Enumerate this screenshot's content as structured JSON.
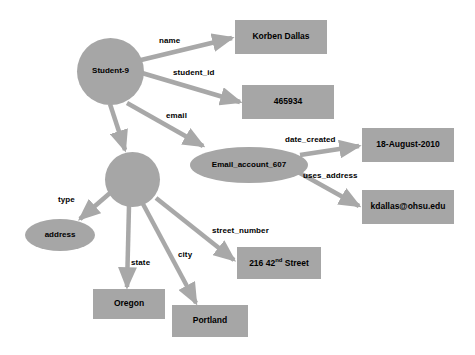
{
  "diagram": {
    "colors": {
      "node_fill": "#a6a6a6",
      "edge_stroke": "#a8a8a8",
      "text": "#000000",
      "background": "#ffffff"
    },
    "nodes": [
      {
        "id": "student",
        "label": "Student-9",
        "shape": "circle",
        "x": 77,
        "y": 38,
        "w": 67,
        "h": 67
      },
      {
        "id": "name_val",
        "label": "Korben Dallas",
        "shape": "rect",
        "x": 235,
        "y": 20,
        "w": 92,
        "h": 34
      },
      {
        "id": "sid_val",
        "label": "465934",
        "shape": "rect",
        "x": 242,
        "y": 85,
        "w": 92,
        "h": 34
      },
      {
        "id": "email_acct",
        "label": "Email_account_607",
        "shape": "ellipse",
        "x": 190,
        "y": 147,
        "w": 118,
        "h": 36
      },
      {
        "id": "date_val",
        "label": "18-August-2010",
        "shape": "rect",
        "x": 362,
        "y": 128,
        "w": 92,
        "h": 34
      },
      {
        "id": "emailaddr_val",
        "label": "kdallas@ohsu.edu",
        "shape": "rect",
        "x": 362,
        "y": 190,
        "w": 92,
        "h": 34
      },
      {
        "id": "addr_node",
        "label": "",
        "shape": "circle",
        "x": 105,
        "y": 152,
        "w": 55,
        "h": 55
      },
      {
        "id": "type_val",
        "label": "address",
        "shape": "ellipse",
        "x": 25,
        "y": 219,
        "w": 70,
        "h": 32
      },
      {
        "id": "street_val",
        "label": "216  42<sup>nd</sup> Street",
        "shape": "rect",
        "x": 237,
        "y": 247,
        "w": 84,
        "h": 32
      },
      {
        "id": "state_val",
        "label": "Oregon",
        "shape": "rect",
        "x": 93,
        "y": 289,
        "w": 72,
        "h": 30
      },
      {
        "id": "city_val",
        "label": "Portland",
        "shape": "rect",
        "x": 172,
        "y": 305,
        "w": 76,
        "h": 32
      }
    ],
    "edges": [
      {
        "id": "e-name",
        "label": "name",
        "from": "student",
        "to": "name_val",
        "x1": 141,
        "y1": 60,
        "x2": 232,
        "y2": 38,
        "lx": 159,
        "ly": 36
      },
      {
        "id": "e-student_id",
        "label": "student_id",
        "from": "student",
        "to": "sid_val",
        "x1": 142,
        "y1": 73,
        "x2": 240,
        "y2": 102,
        "lx": 173,
        "ly": 68
      },
      {
        "id": "e-email",
        "label": "email",
        "from": "student",
        "to": "email_acct",
        "x1": 127,
        "y1": 103,
        "x2": 203,
        "y2": 146,
        "lx": 166,
        "ly": 111
      },
      {
        "id": "e-address",
        "label": "",
        "from": "student",
        "to": "addr_node",
        "x1": 110,
        "y1": 104,
        "x2": 125,
        "y2": 150,
        "lx": 0,
        "ly": 0
      },
      {
        "id": "e-date_created",
        "label": "date_created",
        "from": "email_acct",
        "to": "date_val",
        "x1": 300,
        "y1": 155,
        "x2": 359,
        "y2": 146,
        "lx": 285,
        "ly": 135
      },
      {
        "id": "e-uses_address",
        "label": "uses_address",
        "from": "email_acct",
        "to": "emailaddr_val",
        "x1": 298,
        "y1": 172,
        "x2": 359,
        "y2": 206,
        "lx": 303,
        "ly": 171
      },
      {
        "id": "e-type",
        "label": "type",
        "from": "addr_node",
        "to": "type_val",
        "x1": 110,
        "y1": 193,
        "x2": 80,
        "y2": 219,
        "lx": 58,
        "ly": 195
      },
      {
        "id": "e-state",
        "label": "state",
        "from": "addr_node",
        "to": "state_val",
        "x1": 129,
        "y1": 206,
        "x2": 127,
        "y2": 287,
        "lx": 131,
        "ly": 258
      },
      {
        "id": "e-city",
        "label": "city",
        "from": "addr_node",
        "to": "city_val",
        "x1": 143,
        "y1": 204,
        "x2": 196,
        "y2": 303,
        "lx": 178,
        "ly": 250
      },
      {
        "id": "e-street_number",
        "label": "street_number",
        "from": "addr_node",
        "to": "street_val",
        "x1": 156,
        "y1": 198,
        "x2": 234,
        "y2": 260,
        "lx": 212,
        "ly": 226
      }
    ]
  }
}
